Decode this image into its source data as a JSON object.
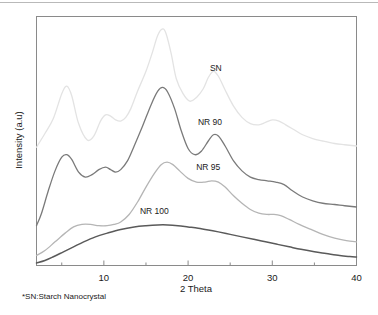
{
  "figure": {
    "footnote": "*SN:Starch Nanocrystal",
    "background_color": "#ffffff"
  },
  "chart_data": {
    "type": "line",
    "title": "",
    "xlabel": "2 Theta",
    "ylabel": "Intensity (a.u)",
    "xlim": [
      2,
      40
    ],
    "ylim": [
      0,
      100
    ],
    "grid": false,
    "legend_position": "inline-annotations",
    "xticks": [
      10,
      20,
      30,
      40
    ],
    "xtick_labels": [
      "10",
      "20",
      "30",
      "40"
    ],
    "xminor_ticks": [
      5,
      15,
      25,
      35
    ],
    "yticks": [],
    "ytick_labels": [],
    "series": [
      {
        "name": "SN",
        "color": "#e3e3e3",
        "width": 1.3,
        "label_x": 23.3,
        "label_y": 78.0,
        "x": [
          2.0,
          3.0,
          4.0,
          5.0,
          5.6,
          6.2,
          7.0,
          8.0,
          8.8,
          9.6,
          10.2,
          10.8,
          11.4,
          12.0,
          12.6,
          13.2,
          14.0,
          15.0,
          15.8,
          16.4,
          17.0,
          17.4,
          18.0,
          18.6,
          19.4,
          20.2,
          21.0,
          21.8,
          22.4,
          23.0,
          23.6,
          24.4,
          25.4,
          26.4,
          27.4,
          28.4,
          29.2,
          30.0,
          30.8,
          31.6,
          32.6,
          33.6,
          34.8,
          36.0,
          37.4,
          38.6,
          40.0
        ],
        "y": [
          47.5,
          53.0,
          59.0,
          69.0,
          72.0,
          68.0,
          57.0,
          50.5,
          52.0,
          58.0,
          60.5,
          60.0,
          58.5,
          58.0,
          59.5,
          63.0,
          70.0,
          78.0,
          86.0,
          92.5,
          95.0,
          93.0,
          85.0,
          75.0,
          69.0,
          66.0,
          67.5,
          71.0,
          75.5,
          78.0,
          76.0,
          70.5,
          64.0,
          59.5,
          57.0,
          56.5,
          57.5,
          58.5,
          58.0,
          56.5,
          54.5,
          52.5,
          51.0,
          50.0,
          49.0,
          48.5,
          48.0
        ]
      },
      {
        "name": "NR 90",
        "color": "#7a7a7a",
        "width": 1.3,
        "label_x": 22.6,
        "label_y": 56.5,
        "x": [
          2.0,
          2.6,
          3.4,
          4.2,
          5.0,
          5.6,
          6.2,
          7.0,
          7.8,
          8.6,
          9.4,
          10.2,
          10.8,
          11.4,
          12.0,
          12.8,
          13.6,
          14.6,
          15.6,
          16.4,
          17.0,
          17.6,
          18.4,
          19.2,
          20.0,
          20.8,
          21.6,
          22.4,
          23.0,
          23.6,
          24.4,
          25.4,
          26.4,
          27.4,
          28.4,
          29.4,
          30.4,
          31.4,
          32.4,
          33.6,
          34.8,
          36.0,
          37.4,
          38.6,
          40.0
        ],
        "y": [
          16.0,
          21.0,
          30.0,
          38.0,
          43.5,
          44.5,
          42.5,
          37.5,
          35.5,
          36.5,
          38.5,
          39.5,
          38.5,
          37.5,
          38.5,
          42.0,
          48.0,
          56.0,
          64.5,
          70.0,
          71.5,
          69.5,
          63.0,
          54.0,
          47.0,
          44.5,
          46.0,
          50.0,
          52.5,
          52.0,
          48.0,
          42.0,
          38.0,
          35.5,
          34.5,
          34.0,
          33.5,
          32.5,
          30.0,
          27.5,
          26.0,
          25.0,
          24.5,
          24.0,
          23.5
        ]
      },
      {
        "name": "NR 95",
        "color": "#b5b5b5",
        "width": 1.3,
        "label_x": 22.4,
        "label_y": 38.5,
        "x": [
          2.0,
          3.0,
          4.2,
          5.4,
          6.4,
          7.4,
          8.4,
          9.4,
          10.4,
          11.2,
          12.0,
          13.0,
          14.0,
          15.0,
          16.0,
          16.8,
          17.5,
          18.2,
          19.0,
          20.0,
          21.0,
          22.0,
          22.8,
          23.6,
          24.4,
          25.4,
          26.4,
          27.4,
          28.4,
          29.4,
          30.2,
          31.0,
          32.0,
          33.2,
          34.6,
          36.0,
          37.4,
          38.8,
          40.0
        ],
        "y": [
          4.0,
          6.0,
          9.5,
          13.0,
          15.5,
          16.5,
          16.5,
          16.0,
          16.0,
          16.5,
          17.5,
          20.5,
          25.5,
          31.5,
          37.0,
          40.5,
          41.5,
          40.5,
          38.0,
          35.0,
          33.5,
          33.5,
          34.0,
          33.5,
          31.5,
          28.0,
          25.0,
          22.5,
          21.0,
          20.5,
          20.5,
          20.0,
          18.5,
          16.5,
          14.5,
          12.5,
          11.0,
          10.0,
          9.5
        ]
      },
      {
        "name": "NR 100",
        "color": "#5a5a5a",
        "width": 1.5,
        "label_x": 16.0,
        "label_y": 20.5,
        "x": [
          2.0,
          3.0,
          4.0,
          5.2,
          6.4,
          7.6,
          9.0,
          10.4,
          12.0,
          13.6,
          15.0,
          16.4,
          17.6,
          18.8,
          20.0,
          21.2,
          22.4,
          23.6,
          25.0,
          26.4,
          27.8,
          29.2,
          30.6,
          32.0,
          33.4,
          35.0,
          36.4,
          38.0,
          39.2,
          40.0
        ],
        "y": [
          1.0,
          2.0,
          3.5,
          5.5,
          7.5,
          9.5,
          11.5,
          13.0,
          14.5,
          15.5,
          16.0,
          16.3,
          16.3,
          16.0,
          15.5,
          15.0,
          14.3,
          13.5,
          12.5,
          11.5,
          10.5,
          9.5,
          8.5,
          7.5,
          6.5,
          5.5,
          4.8,
          4.0,
          3.6,
          3.4
        ]
      }
    ]
  }
}
